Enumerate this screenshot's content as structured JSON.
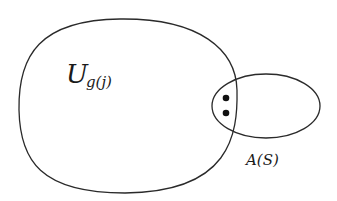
{
  "diagram": {
    "sets": [
      {
        "id": "U",
        "label_main": "U",
        "label_sub": "g(j)"
      },
      {
        "id": "A",
        "label": "A(S)"
      }
    ],
    "intersection_points": 2,
    "colors": {
      "stroke": "#2a2a2a",
      "background": "#ffffff"
    }
  }
}
